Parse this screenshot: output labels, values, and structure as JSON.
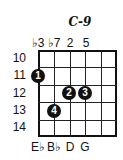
{
  "chord": {
    "title": "C-9",
    "degrees": [
      "♭3",
      "♭7",
      "2",
      "5"
    ],
    "notes": [
      "E♭",
      "B♭",
      "D",
      "G"
    ],
    "frets": [
      "10",
      "11",
      "12",
      "13",
      "14"
    ],
    "dots": [
      {
        "finger": "1",
        "string": 1,
        "fret": 11
      },
      {
        "finger": "2",
        "string": 3,
        "fret": 12
      },
      {
        "finger": "3",
        "string": 4,
        "fret": 12
      },
      {
        "finger": "4",
        "string": 2,
        "fret": 13
      }
    ]
  }
}
